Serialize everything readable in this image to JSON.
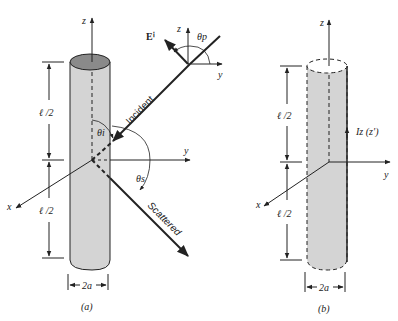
{
  "figure_a": {
    "caption": "(a)",
    "axis_z": "z",
    "axis_y": "y",
    "axis_x": "x",
    "half_length_top": "ℓ /2",
    "half_length_bottom": "ℓ /2",
    "diameter": "2a",
    "incident_label": "Incident",
    "scattered_label": "Scattered",
    "theta_i": "θi",
    "theta_s": "θs",
    "field_label": "Eⁱ",
    "inset_z": "z",
    "inset_y": "y",
    "theta_p": "θp"
  },
  "figure_b": {
    "caption": "(b)",
    "axis_z": "z",
    "axis_y": "y",
    "axis_x": "x",
    "half_length_top": "ℓ /2",
    "half_length_bottom": "ℓ /2",
    "diameter": "2a",
    "current_label": "Iz (z′)"
  },
  "colors": {
    "cylinder_fill": "#d4d4d4",
    "cylinder_top": "#8a8a8a",
    "stroke": "#222222"
  }
}
